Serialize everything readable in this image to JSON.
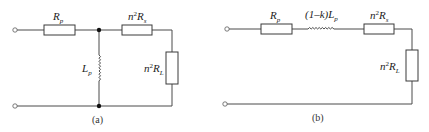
{
  "figure": {
    "circuit_a": {
      "caption": "(a)",
      "components": [
        {
          "id": "Rp",
          "type": "resistor",
          "orientation": "horizontal",
          "label_main": "R",
          "label_sub": "p"
        },
        {
          "id": "Lp",
          "type": "inductor",
          "orientation": "vertical",
          "label_main": "L",
          "label_sub": "p"
        },
        {
          "id": "n2Rs",
          "type": "resistor",
          "orientation": "horizontal",
          "label_pre": "n",
          "label_sup": "2",
          "label_main": "R",
          "label_sub": "s"
        },
        {
          "id": "n2RL",
          "type": "resistor",
          "orientation": "vertical",
          "label_pre": "n",
          "label_sup": "2",
          "label_main": "R",
          "label_sub": "L"
        }
      ],
      "terminals": 2,
      "junctions": 2
    },
    "circuit_b": {
      "caption": "(b)",
      "components": [
        {
          "id": "Rp",
          "type": "resistor",
          "orientation": "horizontal",
          "label_main": "R",
          "label_sub": "p"
        },
        {
          "id": "leak",
          "type": "inductor",
          "orientation": "horizontal",
          "label_pre": "(1–k)",
          "label_main": "L",
          "label_sub": "p"
        },
        {
          "id": "n2Rs",
          "type": "resistor",
          "orientation": "horizontal",
          "label_pre": "n",
          "label_sup": "2",
          "label_main": "R",
          "label_sub": "s"
        },
        {
          "id": "n2RL",
          "type": "resistor",
          "orientation": "vertical",
          "label_pre": "n",
          "label_sup": "2",
          "label_main": "R",
          "label_sub": "L"
        }
      ],
      "terminals": 2
    }
  },
  "colors": {
    "wire": "#4a4a4a",
    "junction": "#111111",
    "background": "#ffffff"
  }
}
